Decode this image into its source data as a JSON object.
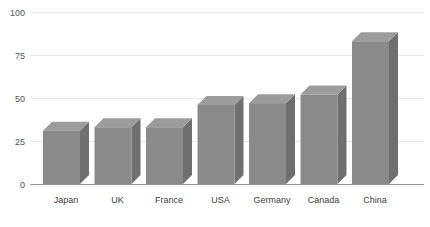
{
  "chart_data": {
    "type": "bar",
    "title": "",
    "subtitle": "",
    "xlabel": "",
    "ylabel": "",
    "categories": [
      "Japan",
      "UK",
      "France",
      "USA",
      "Germany",
      "Canada",
      "China"
    ],
    "values": [
      31,
      33,
      33,
      46,
      47,
      52,
      83
    ],
    "series": [
      {
        "name": "",
        "values": [
          31,
          33,
          33,
          46,
          47,
          52,
          83
        ]
      }
    ],
    "ylim": [
      0,
      100
    ],
    "yticks": [
      0,
      25,
      50,
      75,
      100
    ],
    "ytick_labels": [
      "0",
      "25",
      "50",
      "75",
      "100"
    ],
    "xtick_labels": [
      "Japan",
      "UK",
      "France",
      "USA",
      "Germany",
      "Canada",
      "China"
    ],
    "grid": true,
    "grid_axis": "y",
    "legend": false,
    "legend_position": "none",
    "annotations": [],
    "style": "3d-bar",
    "colors": {
      "bar_front": "#8a8a8a",
      "bar_top": "#9c9c9c",
      "bar_side": "#6f6f6f",
      "gridline": "#e9e9e9",
      "axis_line": "#9b9b9b",
      "tick_text": "#555555",
      "category_text": "#3d3d3d",
      "background": "#ffffff"
    }
  }
}
